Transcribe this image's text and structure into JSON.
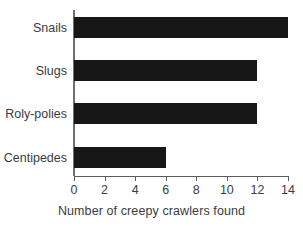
{
  "chart_data": {
    "type": "bar",
    "orientation": "horizontal",
    "title": "",
    "xlabel": "Number of creepy crawlers found",
    "ylabel": "",
    "categories": [
      "Snails",
      "Slugs",
      "Roly-polies",
      "Centipedes"
    ],
    "values": [
      14,
      12,
      12,
      6
    ],
    "xlim": [
      0,
      14
    ],
    "xticks": [
      0,
      2,
      4,
      6,
      8,
      10,
      12,
      14
    ],
    "xtick_labels": [
      "0",
      "2",
      "4",
      "6",
      "8",
      "10",
      "12",
      "14"
    ],
    "grid": false,
    "legend": false,
    "bar_color": "#171717",
    "axis_color": "#5d5d5d",
    "background_color": "#ffffff"
  }
}
